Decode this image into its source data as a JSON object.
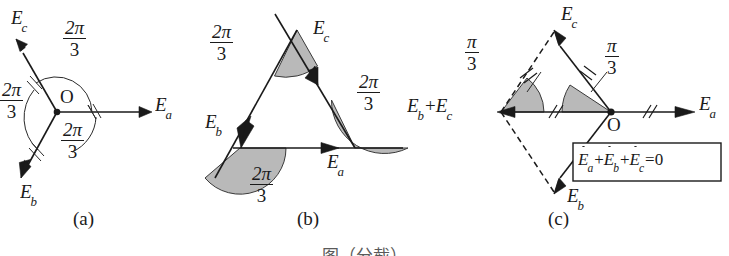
{
  "figure": {
    "panels": [
      {
        "id": "a",
        "caption": "(a)",
        "type": "star-phasor-diagram",
        "origin_label": "O",
        "vectors": [
          {
            "name": "Ea",
            "symbol": "E",
            "subscript": "a",
            "dot": true,
            "direction_deg": 0,
            "label": "Ea"
          },
          {
            "name": "Eb",
            "symbol": "E",
            "subscript": "b",
            "dot": true,
            "direction_deg": 240,
            "label": "Eb"
          },
          {
            "name": "Ec",
            "symbol": "E",
            "subscript": "c",
            "dot": true,
            "direction_deg": 120,
            "label": "Ec"
          }
        ],
        "angles": [
          {
            "value_num": "2π",
            "value_den": "3",
            "between": "Ec-Ea"
          },
          {
            "value_num": "2π",
            "value_den": "3",
            "between": "Ea-Eb"
          },
          {
            "value_num": "2π",
            "value_den": "3",
            "between": "Eb-Ec"
          }
        ]
      },
      {
        "id": "b",
        "caption": "(b)",
        "type": "closed-triangle-phasor-diagram",
        "vectors": [
          {
            "name": "Ea",
            "symbol": "E",
            "subscript": "a",
            "dot": true,
            "label": "Ea"
          },
          {
            "name": "Eb",
            "symbol": "E",
            "subscript": "b",
            "dot": true,
            "label": "Eb"
          },
          {
            "name": "Ec",
            "symbol": "E",
            "subscript": "c",
            "dot": true,
            "label": "Ec"
          }
        ],
        "angles": [
          {
            "value_num": "2π",
            "value_den": "3",
            "at": "top-left"
          },
          {
            "value_num": "2π",
            "value_den": "3",
            "at": "right"
          },
          {
            "value_num": "2π",
            "value_den": "3",
            "at": "bottom-left"
          }
        ]
      },
      {
        "id": "c",
        "caption": "(c)",
        "type": "rhombus-sum-diagram",
        "origin_label": "O",
        "vectors": [
          {
            "name": "Ea",
            "symbol": "E",
            "subscript": "a",
            "dot": true,
            "label": "Ea"
          },
          {
            "name": "Eb",
            "symbol": "E",
            "subscript": "b",
            "dot": true,
            "label": "Eb"
          },
          {
            "name": "Ec",
            "symbol": "E",
            "subscript": "c",
            "dot": true,
            "label": "Ec"
          }
        ],
        "resultant_label": {
          "first": "Eb",
          "op": "+",
          "second": "Ec"
        },
        "angles": [
          {
            "value_num": "π",
            "value_den": "3",
            "at": "left-vertex"
          },
          {
            "value_num": "π",
            "value_den": "3",
            "at": "origin"
          }
        ],
        "tick_marks": {
          "single_slash": "//",
          "double_slash": "//"
        },
        "equation_box": {
          "terms": [
            "Ea",
            "Eb",
            "Ec"
          ],
          "operator": "+",
          "equals": "=",
          "result": "0",
          "text": "Ėa + Ėb + Ėc = 0"
        }
      }
    ],
    "figure_caption": "图（分截）"
  },
  "colors": {
    "ink": "#1a1a1a",
    "sector_fill": "#b9b9b9",
    "sector_stroke": "#3a3a3a",
    "background": "#ffffff"
  }
}
